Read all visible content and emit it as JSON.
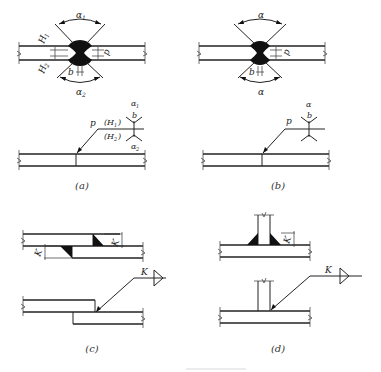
{
  "figure": {
    "type": "welding symbol diagram",
    "panels": [
      {
        "id": "a",
        "caption": "(a)",
        "description": "Double-sided V butt weld with blunt edge, unequal groove depths",
        "labels": {
          "angle_top": "α1",
          "angle_bottom": "α2",
          "depth_top": "H1",
          "depth_bottom": "H2",
          "root_face": "p",
          "gap": "b"
        },
        "symbol": {
          "leader_label": "p",
          "upper_text": "(H1)",
          "lower_text": "(H2)",
          "upper_angle": "α1",
          "gap": "b",
          "lower_angle": "α2"
        }
      },
      {
        "id": "b",
        "caption": "(b)",
        "description": "Double-sided V butt weld with blunt edge, equal grooves",
        "labels": {
          "angle_top": "α",
          "angle_bottom": "α",
          "root_face": "p",
          "gap": "b"
        },
        "symbol": {
          "leader_label": "p",
          "upper_angle": "α",
          "gap": "b"
        }
      },
      {
        "id": "c",
        "caption": "(c)",
        "description": "Lap joint with double fillet welds",
        "labels": {
          "leg_top": "K",
          "leg_bottom": "K"
        },
        "symbol": {
          "size": "K",
          "type": "fillet-both-sides"
        }
      },
      {
        "id": "d",
        "caption": "(d)",
        "description": "T-joint with double fillet welds",
        "labels": {
          "leg": "K"
        },
        "symbol": {
          "size": "K",
          "type": "fillet-both-sides"
        }
      }
    ],
    "caption_text": ""
  },
  "text": {
    "a_alpha1_top": "α",
    "a_alpha1_sub": "1",
    "a_alpha2_bot": "α",
    "a_alpha2_sub": "2",
    "a_H": "H",
    "a_H1_sub": "1",
    "a_H2_sub": "2",
    "a_p": "p",
    "a_b": "b",
    "a_sym_p": "p",
    "a_sym_H1": "(H",
    "a_sym_H1_sub": "1",
    "a_sym_H1_close": ")",
    "a_sym_H2": "(H",
    "a_sym_H2_sub": "2",
    "a_sym_H2_close": ")",
    "a_sym_alpha1": "α",
    "a_sym_alpha1_sub": "1",
    "a_sym_b": "b",
    "a_sym_alpha2": "α",
    "a_sym_alpha2_sub": "2",
    "cap_a": "(a)",
    "b_alpha_top": "α",
    "b_alpha_bot": "α",
    "b_p": "p",
    "b_b": "b",
    "b_sym_p": "p",
    "b_sym_alpha": "α",
    "b_sym_b": "b",
    "cap_b": "(b)",
    "c_K1": "K",
    "c_K2": "K",
    "c_sym_K": "K",
    "cap_c": "(c)",
    "d_K": "K",
    "d_sym_K": "K",
    "cap_d": "(d)"
  }
}
